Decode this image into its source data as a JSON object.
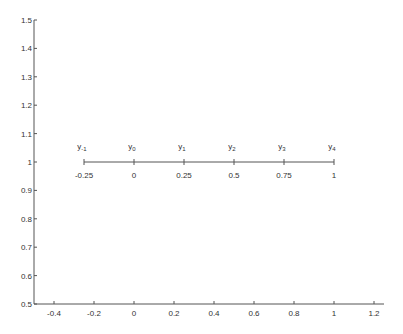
{
  "chart_data": {
    "type": "line",
    "title": "",
    "xlabel": "",
    "ylabel": "",
    "xlim": [
      -0.5,
      1.25
    ],
    "ylim": [
      0.5,
      1.5
    ],
    "grid": false,
    "x_ticks": [
      "-0.4",
      "-0.2",
      "0",
      "0.2",
      "0.4",
      "0.6",
      "0.8",
      "1",
      "1.2"
    ],
    "x_tick_values": [
      -0.4,
      -0.2,
      0,
      0.2,
      0.4,
      0.6,
      0.8,
      1,
      1.2
    ],
    "y_ticks": [
      "0.5",
      "0.6",
      "0.7",
      "0.8",
      "0.9",
      "1",
      "1.1",
      "1.2",
      "1.3",
      "1.4",
      "1.5"
    ],
    "y_tick_values": [
      0.5,
      0.6,
      0.7,
      0.8,
      0.9,
      1.0,
      1.1,
      1.2,
      1.3,
      1.4,
      1.5
    ],
    "series": [
      {
        "name": "grid line",
        "x": [
          -0.25,
          0,
          0.25,
          0.5,
          0.75,
          1
        ],
        "y": [
          1,
          1,
          1,
          1,
          1,
          1
        ]
      }
    ],
    "points": [
      {
        "x": -0.25,
        "value_label": "-0.25",
        "name_base": "y",
        "name_sub": "-1"
      },
      {
        "x": 0,
        "value_label": "0",
        "name_base": "y",
        "name_sub": "0"
      },
      {
        "x": 0.25,
        "value_label": "0.25",
        "name_base": "y",
        "name_sub": "1"
      },
      {
        "x": 0.5,
        "value_label": "0.5",
        "name_base": "y",
        "name_sub": "2"
      },
      {
        "x": 0.75,
        "value_label": "0.75",
        "name_base": "y",
        "name_sub": "3"
      },
      {
        "x": 1,
        "value_label": "1",
        "name_base": "y",
        "name_sub": "4"
      }
    ]
  }
}
